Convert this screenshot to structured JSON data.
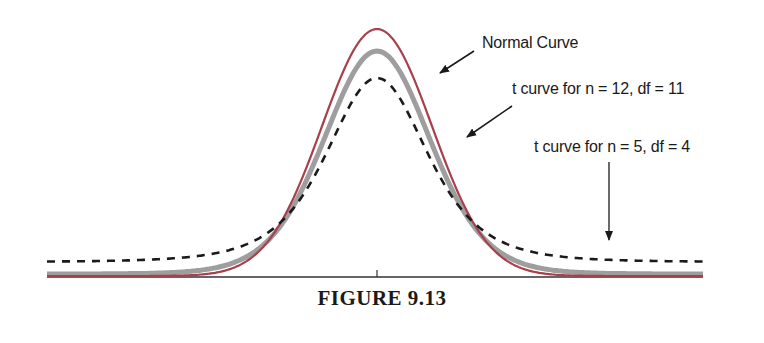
{
  "caption": "FIGURE 9.13",
  "colors": {
    "normal": "#a8404c",
    "t12": "#9e9e9e",
    "t5": "#1a1a1a",
    "axis": "#333333"
  },
  "chart_data": {
    "type": "line",
    "title": "FIGURE 9.13",
    "xlabel": "",
    "ylabel": "",
    "grid": false,
    "legend_position": "annotations with arrows",
    "x_ticks": [
      "0 (center tick)"
    ],
    "series": [
      {
        "name": "Normal Curve",
        "style": "solid dark red",
        "distribution": "standard normal",
        "peak_density": 0.399
      },
      {
        "name": "t curve for n = 12, df = 11",
        "style": "thick solid gray",
        "distribution": "Student t, df=11",
        "peak_density": 0.391
      },
      {
        "name": "t curve for n = 5, df = 4",
        "style": "dashed black",
        "distribution": "Student t, df=4",
        "peak_density": 0.375
      }
    ],
    "annotations": [
      {
        "text": "Normal Curve",
        "points_to": "Normal Curve"
      },
      {
        "text": "t curve for n = 12, df = 11",
        "points_to": "t df=11"
      },
      {
        "text": "t curve for n = 5, df = 4",
        "points_to": "t df=4 tail"
      }
    ]
  },
  "labels": {
    "normal": "Normal Curve",
    "t12": "t curve for n = 12, df = 11",
    "t5": "t curve for n = 5, df = 4"
  }
}
